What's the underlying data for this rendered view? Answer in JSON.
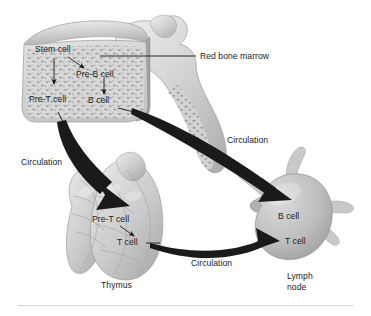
{
  "figure": {
    "background_color": "#ffffff",
    "text_color": "#1d1d1d",
    "organ_fill": "#cfcfcf",
    "organ_shadow": "#9a9a9a",
    "organ_highlight": "#ececec",
    "arrow_color": "#1a1a1a"
  },
  "organs": [
    {
      "name": "red-bone-marrow",
      "label": "Red bone marrow"
    },
    {
      "name": "thymus",
      "label": "Thymus"
    },
    {
      "name": "lymph-node",
      "label_line1": "Lymph",
      "label_line2": "node"
    }
  ],
  "marrow_labels": {
    "stem_cell": "Stem cell",
    "pre_b_cell": "Pre-B cell",
    "pre_t_cell": "Pre-T cell",
    "b_cell": "B cell"
  },
  "thymus_labels": {
    "pre_t_cell": "Pre-T cell",
    "t_cell": "T cell"
  },
  "lymph_node_labels": {
    "b_cell": "B cell",
    "t_cell": "T cell"
  },
  "circulation_labels": {
    "marrow_to_thymus": "Circulation",
    "marrow_to_node": "Circulation",
    "thymus_to_node": "Circulation"
  }
}
